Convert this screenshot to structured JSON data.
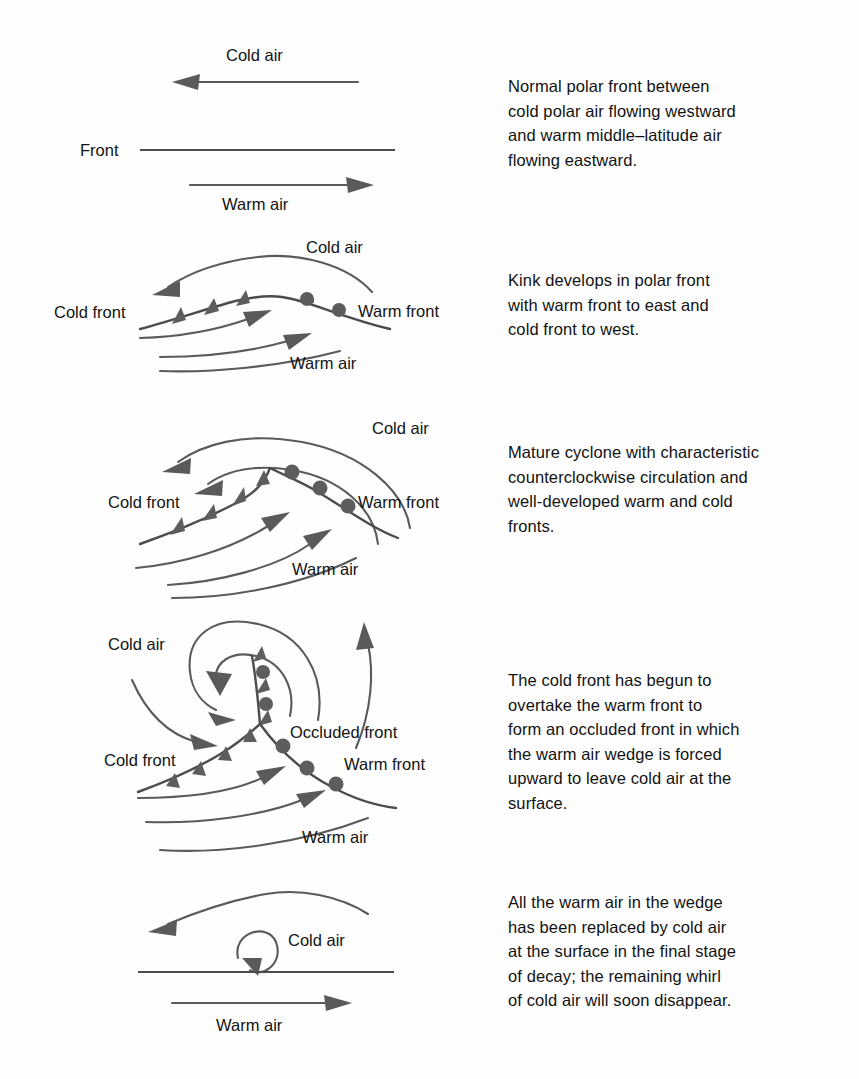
{
  "figure": {
    "line_color": "#4c4c4e",
    "symbol_color": "#5d5d5f",
    "background": "#ffffff"
  },
  "stages": [
    {
      "id": "stage-1-normal-polar-front",
      "caption": "Normal polar front between\ncold polar air flowing westward\nand warm middle–latitude air\nflowing eastward.",
      "labels": {
        "cold_air": "Cold air",
        "front": "Front",
        "warm_air": "Warm air"
      }
    },
    {
      "id": "stage-2-kink-develops",
      "caption": "Kink develops in polar front\nwith warm front to east and\ncold front to west.",
      "labels": {
        "cold_air": "Cold air",
        "cold_front": "Cold front",
        "warm_front": "Warm front",
        "warm_air": "Warm air"
      }
    },
    {
      "id": "stage-3-mature-cyclone",
      "caption": "Mature cyclone with characteristic\ncounterclockwise circulation and\nwell-developed warm and cold\nfronts.",
      "labels": {
        "cold_air": "Cold air",
        "cold_front": "Cold front",
        "warm_front": "Warm front",
        "warm_air": "Warm air"
      }
    },
    {
      "id": "stage-4-occlusion",
      "caption": "The cold front has begun to\novertake the warm front to\nform an occluded front in which\nthe warm air wedge is forced\nupward to leave cold air at the\nsurface.",
      "labels": {
        "cold_air": "Cold air",
        "cold_front": "Cold front",
        "occluded_front": "Occluded front",
        "warm_front": "Warm front",
        "warm_air": "Warm air"
      }
    },
    {
      "id": "stage-5-decay",
      "caption": "All the warm air in the wedge\nhas been replaced by cold air\nat the surface in the final stage\nof decay; the remaining whirl\nof cold air will soon disappear.",
      "labels": {
        "cold_air": "Cold air",
        "warm_air": "Warm air"
      }
    }
  ]
}
